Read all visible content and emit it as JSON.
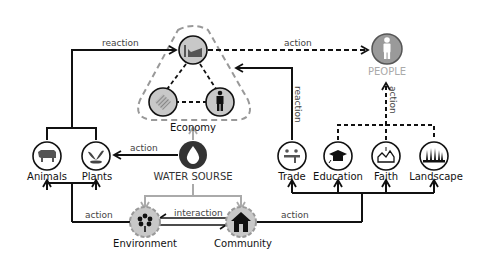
{
  "nodes": {
    "economy": {
      "label": "Economy",
      "sub_icons": [
        "factory-icon",
        "crosshatch-icon",
        "worker-icon"
      ]
    },
    "people": {
      "label": "PEOPLE",
      "icon": "person-icon",
      "color": "#9a9a9a"
    },
    "water_source": {
      "label": "WATER SOURSE",
      "icon": "water-drop-icon"
    },
    "animals": {
      "label": "Animals",
      "icon": "cow-icon"
    },
    "plants": {
      "label": "Plants",
      "icon": "plant-icon"
    },
    "trade": {
      "label": "Trade",
      "icon": "trade-icon"
    },
    "education": {
      "label": "Education",
      "icon": "graduation-cap-icon"
    },
    "faith": {
      "label": "Faith",
      "icon": "church-icon"
    },
    "landscape": {
      "label": "Landscape",
      "icon": "trees-icon"
    },
    "environment": {
      "label": "Environment",
      "icon": "flower-icon"
    },
    "community": {
      "label": "Community",
      "icon": "house-icon"
    }
  },
  "edges": {
    "reaction_top_left": "reaction",
    "action_top": "action",
    "reaction_vertical": "reaction",
    "action_people": "action",
    "action_water_plants": "action",
    "action_bottom_left": "action",
    "interaction": "interaction",
    "action_bottom_right": "action"
  },
  "colors": {
    "line": "#111111",
    "gray_line": "#aaaaaa",
    "node_fill_gray": "#c8c8c8",
    "dark_node": "#333333"
  }
}
